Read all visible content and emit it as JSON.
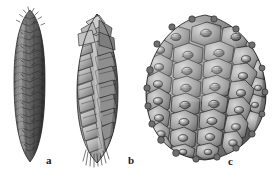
{
  "figure": {
    "kind": "scientific-illustration",
    "background_color": "#ffffff",
    "ink_color": "#1c1c1c",
    "palette": {
      "darkest": "#3a3a3a",
      "dark": "#565656",
      "mid": "#7d7d7d",
      "light": "#a8a8a8",
      "lightest": "#d4d4d4",
      "highlight": "#ececec"
    },
    "width": 275,
    "height": 178
  },
  "specimens": [
    {
      "key": "a",
      "label": "a",
      "description": "narrow elongated cone with dense small prickly scales",
      "shape": "slender-cylindrical",
      "scale_texture": "fine-rhombic-with-prickles",
      "bbox": {
        "x": 12,
        "y": 10,
        "width": 36,
        "height": 153
      },
      "tone": "dark"
    },
    {
      "key": "b",
      "label": "b",
      "description": "ovoid-oblong cone with large flaring overlapping scales and frayed base",
      "shape": "oblong-tapered",
      "scale_texture": "broad-overlapping-plates",
      "bbox": {
        "x": 76,
        "y": 12,
        "width": 44,
        "height": 153
      },
      "tone": "light"
    },
    {
      "key": "c",
      "label": "c",
      "description": "large broad ovoid cone with thick polygonal scales each bearing a raised central umbo",
      "shape": "broad-ovoid",
      "scale_texture": "hexagonal-umbonate",
      "bbox": {
        "x": 145,
        "y": 14,
        "width": 122,
        "height": 148
      },
      "tone": "mid"
    }
  ],
  "labels": {
    "a": "a",
    "b": "b",
    "c": "c"
  }
}
